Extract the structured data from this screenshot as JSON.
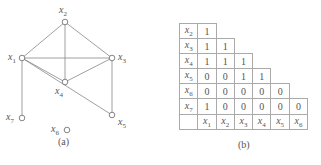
{
  "graph": {
    "nodes": [
      {
        "id": "x1",
        "name": "x",
        "sub": "1",
        "x": 22,
        "y": 58
      },
      {
        "id": "x2",
        "name": "x",
        "sub": "2",
        "x": 65,
        "y": 22
      },
      {
        "id": "x3",
        "name": "x",
        "sub": "3",
        "x": 112,
        "y": 58
      },
      {
        "id": "x4",
        "name": "x",
        "sub": "4",
        "x": 65,
        "y": 82
      },
      {
        "id": "x5",
        "name": "x",
        "sub": "5",
        "x": 112,
        "y": 115
      },
      {
        "id": "x6",
        "name": "x",
        "sub": "6",
        "x": 67,
        "y": 130
      },
      {
        "id": "x7",
        "name": "x",
        "sub": "7",
        "x": 22,
        "y": 118
      }
    ],
    "edges": [
      [
        "x1",
        "x2"
      ],
      [
        "x1",
        "x3"
      ],
      [
        "x1",
        "x4"
      ],
      [
        "x1",
        "x7"
      ],
      [
        "x1",
        "x5"
      ],
      [
        "x2",
        "x3"
      ],
      [
        "x2",
        "x4"
      ],
      [
        "x3",
        "x4"
      ],
      [
        "x3",
        "x5"
      ]
    ],
    "caption": "(a)"
  },
  "table": {
    "rows": [
      {
        "label": "x",
        "sub": "2",
        "values": [
          "1"
        ]
      },
      {
        "label": "x",
        "sub": "3",
        "values": [
          "1",
          "1"
        ]
      },
      {
        "label": "x",
        "sub": "4",
        "values": [
          "1",
          "1",
          "1"
        ]
      },
      {
        "label": "x",
        "sub": "5",
        "values": [
          "0",
          "0",
          "1",
          "1"
        ]
      },
      {
        "label": "x",
        "sub": "6",
        "values": [
          "0",
          "0",
          "0",
          "0",
          "0"
        ]
      },
      {
        "label": "x",
        "sub": "7",
        "values": [
          "1",
          "0",
          "0",
          "0",
          "0",
          "0"
        ]
      }
    ],
    "columns": [
      {
        "label": "x",
        "sub": "1"
      },
      {
        "label": "x",
        "sub": "2"
      },
      {
        "label": "x",
        "sub": "3"
      },
      {
        "label": "x",
        "sub": "4"
      },
      {
        "label": "x",
        "sub": "5"
      },
      {
        "label": "x",
        "sub": "6"
      }
    ],
    "caption": "(b)"
  },
  "figure_caption": "图 ... (caption cut off / illegible)"
}
